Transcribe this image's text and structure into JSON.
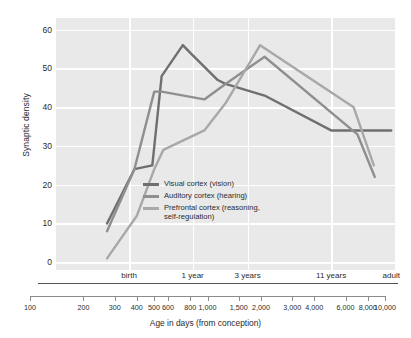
{
  "chart_data": {
    "type": "line",
    "title": "",
    "xlabel": "Age in days (from conception)",
    "ylabel": "Synaptic density",
    "xscale": "log",
    "xlim": [
      100,
      10000
    ],
    "ylim": [
      -2,
      63
    ],
    "grid": true,
    "legend_position": "inside-center-left",
    "yticks": [
      0,
      10,
      20,
      30,
      40,
      50,
      60
    ],
    "xticks": [
      "100",
      "200",
      "300",
      "400",
      "500",
      "600",
      "800",
      "1,000",
      "1,500",
      "2,000",
      "3,000",
      "4,000",
      "6,000",
      "8,000",
      "10,000"
    ],
    "xtick_values": [
      100,
      200,
      300,
      400,
      500,
      600,
      800,
      1000,
      1500,
      2000,
      3000,
      4000,
      6000,
      8000,
      10000
    ],
    "era_labels": [
      {
        "label": "birth",
        "days": 270
      },
      {
        "label": "1 year",
        "days": 640
      },
      {
        "label": "3 years",
        "days": 1350
      },
      {
        "label": "11 years",
        "days": 4200
      },
      {
        "label": "adult",
        "days": 9500
      }
    ],
    "gridline_days": [
      270,
      640,
      1350,
      4200
    ],
    "series": [
      {
        "name": "Visual cortex (vision)",
        "color": "#6f6f6f",
        "points": [
          {
            "x": 200,
            "y": 10
          },
          {
            "x": 290,
            "y": 24
          },
          {
            "x": 370,
            "y": 25
          },
          {
            "x": 420,
            "y": 48
          },
          {
            "x": 560,
            "y": 56
          },
          {
            "x": 620,
            "y": 54
          },
          {
            "x": 900,
            "y": 47
          },
          {
            "x": 1000,
            "y": 46
          },
          {
            "x": 1700,
            "y": 43
          },
          {
            "x": 4200,
            "y": 34
          },
          {
            "x": 6000,
            "y": 34
          },
          {
            "x": 9500,
            "y": 34
          }
        ]
      },
      {
        "name": "Auditory cortex (hearing)",
        "color": "#8f8f8f",
        "points": [
          {
            "x": 200,
            "y": 8
          },
          {
            "x": 290,
            "y": 24
          },
          {
            "x": 380,
            "y": 44
          },
          {
            "x": 420,
            "y": 44
          },
          {
            "x": 750,
            "y": 42
          },
          {
            "x": 1000,
            "y": 46
          },
          {
            "x": 1700,
            "y": 53
          },
          {
            "x": 6000,
            "y": 33
          },
          {
            "x": 7600,
            "y": 22
          }
        ]
      },
      {
        "name": "Prefrontal cortex (reasoning, self-regulation)",
        "color": "#a8a8a8",
        "points": [
          {
            "x": 200,
            "y": 1
          },
          {
            "x": 300,
            "y": 12
          },
          {
            "x": 380,
            "y": 24
          },
          {
            "x": 430,
            "y": 29
          },
          {
            "x": 750,
            "y": 34
          },
          {
            "x": 1000,
            "y": 41
          },
          {
            "x": 1600,
            "y": 56
          },
          {
            "x": 5700,
            "y": 40
          },
          {
            "x": 7500,
            "y": 25
          }
        ]
      }
    ],
    "legend": [
      {
        "label": "Visual cortex (vision)",
        "color": "#6f6f6f"
      },
      {
        "label": "Auditory cortex (hearing)",
        "color": "#8f8f8f"
      },
      {
        "label": "Prefrontal cortex (reasoning,\nself-regulation)",
        "color": "#a8a8a8"
      }
    ]
  },
  "colors": {
    "panel_background": "#e9e9e9",
    "gridline": "#ffffff",
    "axis": "#555555",
    "ruler": "#8c8c8c",
    "text": "#2b2b2b",
    "page_background": "#ffffff"
  }
}
